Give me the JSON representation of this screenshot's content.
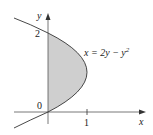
{
  "diagram": {
    "equation": "x = 2y − y²",
    "equation_parts": {
      "lhs": "x = 2y − y",
      "exp": "2"
    },
    "axis_labels": {
      "x": "x",
      "y": "y"
    },
    "ticks": {
      "y_top": "2",
      "origin": "0",
      "x_one": "1"
    },
    "colors": {
      "fill": "#cfcfcf",
      "stroke": "#333333",
      "axis": "#555555"
    }
  }
}
